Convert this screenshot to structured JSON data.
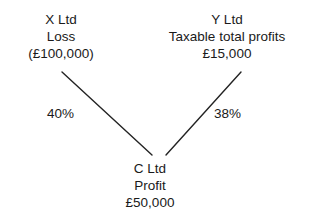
{
  "diagram": {
    "type": "group-relief-claim-diagram",
    "nodes": {
      "x_ltd": {
        "name": "X Ltd",
        "descriptor": "Loss",
        "amount": "(£100,000)"
      },
      "y_ltd": {
        "name": "Y Ltd",
        "descriptor": "Taxable total profits",
        "amount": "£15,000"
      },
      "c_ltd": {
        "name": "C Ltd",
        "descriptor": "Profit",
        "amount": "£50,000"
      }
    },
    "connectors": [
      {
        "id": "x-to-c",
        "from": "x_ltd",
        "to": "c_ltd",
        "label": "40%"
      },
      {
        "id": "y-to-c",
        "from": "y_ltd",
        "to": "c_ltd",
        "label": "38%"
      }
    ],
    "colors": {
      "background": "#ffffff",
      "text": "#1a1a1a",
      "line": "#232323"
    }
  }
}
